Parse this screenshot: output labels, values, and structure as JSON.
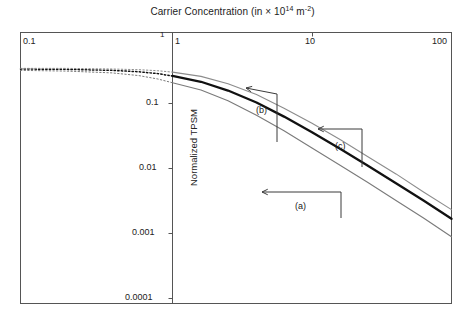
{
  "chart_data": {
    "type": "line",
    "title_main": "Carrier Concentration (in × 10",
    "title_sup1": "14",
    "title_mid": " m",
    "title_sup2": "-2",
    "title_end": ")",
    "xlabel": "Carrier Concentration (in × 10^14 m^-2)",
    "ylabel": "Normalized TPSM",
    "xscale": "log",
    "yscale": "log",
    "grid": false,
    "legend": "inline-annotations",
    "split_axis": true,
    "panels": [
      {
        "name": "left-panel",
        "xlim": [
          0.1,
          1
        ],
        "xticks": [
          0.1,
          1
        ],
        "xtick_labels": [
          "0.1",
          "1"
        ],
        "style": "dotted"
      },
      {
        "name": "right-panel",
        "xlim": [
          1,
          100
        ],
        "xticks": [
          1,
          10,
          100
        ],
        "xtick_labels": [
          "1",
          "10",
          "100"
        ],
        "style": "solid"
      }
    ],
    "ylim": [
      0.0001,
      0.3
    ],
    "yticks": [
      0.1,
      0.01,
      0.001,
      0.0001
    ],
    "ytick_labels": [
      "0.1",
      "0.01",
      "0.001",
      "0.0001"
    ],
    "series": [
      {
        "name": "(a)",
        "label": "(a)",
        "color": "#7a7a7a",
        "width": 1.1,
        "left_points": [
          {
            "x": 0.1,
            "y": 0.098
          },
          {
            "x": 0.2,
            "y": 0.096
          },
          {
            "x": 0.4,
            "y": 0.091
          },
          {
            "x": 0.6,
            "y": 0.084
          },
          {
            "x": 0.8,
            "y": 0.076
          },
          {
            "x": 1.0,
            "y": 0.068
          }
        ],
        "right_points": [
          {
            "x": 1,
            "y": 0.068
          },
          {
            "x": 1.6,
            "y": 0.055
          },
          {
            "x": 2.5,
            "y": 0.04
          },
          {
            "x": 4,
            "y": 0.026
          },
          {
            "x": 6.3,
            "y": 0.0165
          },
          {
            "x": 10,
            "y": 0.0099
          },
          {
            "x": 16,
            "y": 0.0059
          },
          {
            "x": 25,
            "y": 0.0036
          },
          {
            "x": 40,
            "y": 0.0021
          },
          {
            "x": 63,
            "y": 0.00125
          },
          {
            "x": 100,
            "y": 0.00072
          }
        ]
      },
      {
        "name": "(b)",
        "label": "(b)",
        "color": "#111111",
        "width": 2.3,
        "left_points": [
          {
            "x": 0.1,
            "y": 0.102
          },
          {
            "x": 0.2,
            "y": 0.101
          },
          {
            "x": 0.4,
            "y": 0.098
          },
          {
            "x": 0.6,
            "y": 0.094
          },
          {
            "x": 0.8,
            "y": 0.089
          },
          {
            "x": 1.0,
            "y": 0.083
          }
        ],
        "right_points": [
          {
            "x": 1,
            "y": 0.083
          },
          {
            "x": 1.6,
            "y": 0.07
          },
          {
            "x": 2.5,
            "y": 0.054
          },
          {
            "x": 4,
            "y": 0.038
          },
          {
            "x": 6.3,
            "y": 0.025
          },
          {
            "x": 10,
            "y": 0.0158
          },
          {
            "x": 16,
            "y": 0.0096
          },
          {
            "x": 25,
            "y": 0.0059
          },
          {
            "x": 40,
            "y": 0.0035
          },
          {
            "x": 63,
            "y": 0.0021
          },
          {
            "x": 100,
            "y": 0.00122
          }
        ]
      },
      {
        "name": "(c)",
        "label": "(c)",
        "color": "#8c8c8c",
        "width": 1.1,
        "left_points": [
          {
            "x": 0.1,
            "y": 0.104
          },
          {
            "x": 0.2,
            "y": 0.104
          },
          {
            "x": 0.4,
            "y": 0.102
          },
          {
            "x": 0.6,
            "y": 0.1
          },
          {
            "x": 0.8,
            "y": 0.097
          },
          {
            "x": 1.0,
            "y": 0.093
          }
        ],
        "right_points": [
          {
            "x": 1,
            "y": 0.093
          },
          {
            "x": 1.6,
            "y": 0.082
          },
          {
            "x": 2.5,
            "y": 0.066
          },
          {
            "x": 4,
            "y": 0.048
          },
          {
            "x": 6.3,
            "y": 0.032
          },
          {
            "x": 10,
            "y": 0.0205
          },
          {
            "x": 16,
            "y": 0.0126
          },
          {
            "x": 25,
            "y": 0.0077
          },
          {
            "x": 40,
            "y": 0.0046
          },
          {
            "x": 63,
            "y": 0.0027
          },
          {
            "x": 100,
            "y": 0.0016
          }
        ]
      }
    ],
    "annotations": [
      {
        "label": "(a)",
        "text_x": 295,
        "text_y": 201,
        "arrow_tip_x": 262,
        "arrow_tip_y": 192,
        "elbow_x": 341,
        "elbow_y": 192,
        "kind": "horizontal"
      },
      {
        "label": "(b)",
        "text_x": 256,
        "text_y": 105,
        "arrow_tip_x": 246,
        "arrow_tip_y": 88,
        "elbow_x": 277,
        "elbow_y": 94,
        "kind": "elbow"
      },
      {
        "label": "(c)",
        "text_x": 335,
        "text_y": 141,
        "arrow_tip_x": 318,
        "arrow_tip_y": 129,
        "elbow_x": 362,
        "elbow_y": 129,
        "kind": "elbow"
      }
    ]
  }
}
